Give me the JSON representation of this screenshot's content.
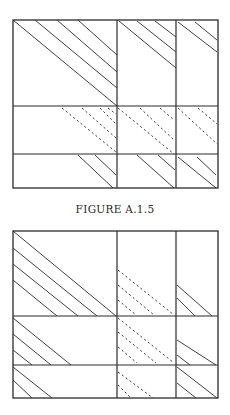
{
  "colors": {
    "line": "#2b2b2b",
    "background": "#ffffff"
  },
  "figures": [
    {
      "caption": "FIGURE A.1.5",
      "box": {
        "x": 13,
        "y": 20,
        "w": 205,
        "h": 168
      },
      "cols": [
        13,
        117,
        176,
        218
      ],
      "rows": [
        20,
        106,
        154,
        188
      ],
      "solid_lines": [
        [
          13,
          20,
          117,
          106
        ],
        [
          35,
          20,
          117,
          88
        ],
        [
          57,
          20,
          117,
          72
        ],
        [
          78,
          20,
          117,
          55
        ],
        [
          119,
          21,
          176,
          68
        ],
        [
          137,
          21,
          176,
          52
        ],
        [
          155,
          21,
          176,
          37
        ],
        [
          178,
          22,
          217,
          52
        ],
        [
          195,
          22,
          217,
          40
        ],
        [
          78,
          155,
          113,
          188
        ],
        [
          95,
          155,
          116,
          175
        ],
        [
          137,
          155,
          174,
          188
        ],
        [
          158,
          155,
          175,
          170
        ],
        [
          178,
          157,
          216,
          188
        ],
        [
          197,
          157,
          216,
          175
        ]
      ],
      "dashed_lines": [
        [
          62,
          108,
          116,
          152
        ],
        [
          82,
          108,
          116,
          138
        ],
        [
          100,
          108,
          116,
          124
        ],
        [
          108,
          108,
          116,
          114
        ],
        [
          118,
          108,
          174,
          154
        ],
        [
          140,
          108,
          174,
          140
        ],
        [
          160,
          108,
          174,
          120
        ],
        [
          178,
          108,
          217,
          144
        ],
        [
          198,
          108,
          217,
          124
        ]
      ]
    },
    {
      "caption": "",
      "box": {
        "x": 13,
        "y": 231,
        "w": 205,
        "h": 167
      },
      "cols": [
        13,
        117,
        176,
        218
      ],
      "rows": [
        231,
        316,
        365,
        398
      ],
      "solid_lines": [
        [
          13,
          231,
          116,
          316
        ],
        [
          13,
          248,
          97,
          316
        ],
        [
          13,
          264,
          78,
          316
        ],
        [
          13,
          280,
          57,
          316
        ],
        [
          177,
          285,
          212,
          316
        ],
        [
          177,
          298,
          195,
          316
        ],
        [
          13,
          318,
          71,
          365
        ],
        [
          13,
          334,
          51,
          365
        ],
        [
          13,
          350,
          32,
          365
        ],
        [
          177,
          340,
          216,
          365
        ],
        [
          177,
          355,
          190,
          365
        ],
        [
          13,
          367,
          52,
          398
        ],
        [
          13,
          380,
          32,
          398
        ],
        [
          177,
          367,
          217,
          398
        ],
        [
          177,
          383,
          196,
          398
        ]
      ],
      "dashed_lines": [
        [
          118,
          270,
          174,
          315
        ],
        [
          118,
          285,
          154,
          315
        ],
        [
          118,
          300,
          136,
          315
        ],
        [
          118,
          318,
          174,
          363
        ],
        [
          118,
          332,
          156,
          363
        ],
        [
          118,
          347,
          137,
          363
        ],
        [
          118,
          372,
          153,
          398
        ],
        [
          118,
          385,
          131,
          398
        ]
      ]
    }
  ]
}
